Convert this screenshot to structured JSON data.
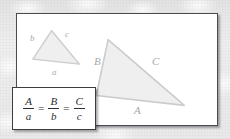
{
  "figure": {
    "panel": {
      "background_color": "#ffffff",
      "border_color": "#4a4a50"
    },
    "background": {
      "texture": "light-gray-paper",
      "color": "#ebebeb"
    },
    "triangles": [
      {
        "name": "small-triangle",
        "fill_color": "#efefef",
        "stroke_color": "#c9c9cd",
        "labels": [
          {
            "text": "b",
            "side": "left",
            "x": 29,
            "y": 33
          },
          {
            "text": "c",
            "side": "right",
            "x": 64,
            "y": 29
          },
          {
            "text": "a",
            "side": "bottom",
            "x": 51,
            "y": 68
          }
        ]
      },
      {
        "name": "large-triangle",
        "fill_color": "#efefef",
        "stroke_color": "#c9c9cd",
        "labels": [
          {
            "text": "B",
            "side": "left",
            "x": 110,
            "y": 56
          },
          {
            "text": "C",
            "side": "right",
            "x": 167,
            "y": 56
          },
          {
            "text": "A",
            "side": "bottom",
            "x": 149,
            "y": 105
          }
        ]
      }
    ],
    "formula": {
      "expression": "A/a = B/b = C/c",
      "terms": [
        {
          "numerator": "A",
          "denominator": "a"
        },
        {
          "numerator": "B",
          "denominator": "b"
        },
        {
          "numerator": "C",
          "denominator": "c"
        }
      ],
      "operators": [
        "=",
        "="
      ],
      "box_border_color": "#3b3b41"
    }
  }
}
